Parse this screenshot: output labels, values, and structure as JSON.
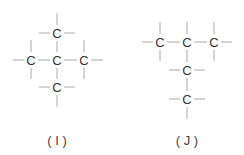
{
  "structures": [
    {
      "id": "I",
      "label": "( I )",
      "atoms": [
        {
          "symbol": "C",
          "x": 57,
          "y": 33
        },
        {
          "symbol": "C",
          "x": 31,
          "y": 60
        },
        {
          "symbol": "C",
          "x": 57,
          "y": 60
        },
        {
          "symbol": "C",
          "x": 84,
          "y": 60
        },
        {
          "symbol": "C",
          "x": 57,
          "y": 87
        }
      ],
      "label_pos": {
        "x": 57,
        "y": 140
      }
    },
    {
      "id": "J",
      "label": "( J )",
      "atoms": [
        {
          "symbol": "C",
          "x": 160,
          "y": 42
        },
        {
          "symbol": "C",
          "x": 187,
          "y": 42
        },
        {
          "symbol": "C",
          "x": 214,
          "y": 42
        },
        {
          "symbol": "C",
          "x": 187,
          "y": 70
        },
        {
          "symbol": "C",
          "x": 187,
          "y": 99
        }
      ],
      "label_pos": {
        "x": 187,
        "y": 140
      }
    }
  ],
  "colors": {
    "bond": "#aaaaaa",
    "atom": "#333333",
    "background": "#ffffff"
  }
}
